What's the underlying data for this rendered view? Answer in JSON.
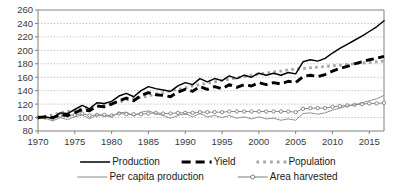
{
  "chart_data": {
    "type": "line",
    "title": "",
    "subtitle": "",
    "xlabel": "",
    "ylabel": "",
    "xlim": [
      1970,
      2017
    ],
    "ylim": [
      80,
      260
    ],
    "ytick_step": 20,
    "xtick_step": 5,
    "grid": "horizontal-dotted",
    "legend_position": "bottom",
    "yticks": [
      80,
      100,
      120,
      140,
      160,
      180,
      200,
      220,
      240,
      260
    ],
    "xticks": [
      1970,
      1975,
      1980,
      1985,
      1990,
      1995,
      2000,
      2005,
      2010,
      2015
    ],
    "x": [
      1970,
      1971,
      1972,
      1973,
      1974,
      1975,
      1976,
      1977,
      1978,
      1979,
      1980,
      1981,
      1982,
      1983,
      1984,
      1985,
      1986,
      1987,
      1988,
      1989,
      1990,
      1991,
      1992,
      1993,
      1994,
      1995,
      1996,
      1997,
      1998,
      1999,
      2000,
      2001,
      2002,
      2003,
      2004,
      2005,
      2006,
      2007,
      2008,
      2009,
      2010,
      2011,
      2012,
      2013,
      2014,
      2015,
      2016,
      2017
    ],
    "series": [
      {
        "name": "Production",
        "style": "solid-black-thin",
        "color": "#000000",
        "values": [
          100,
          101,
          99,
          107,
          106,
          112,
          118,
          113,
          122,
          121,
          124,
          132,
          136,
          131,
          140,
          146,
          143,
          141,
          139,
          147,
          152,
          149,
          158,
          153,
          158,
          155,
          162,
          158,
          163,
          160,
          166,
          163,
          166,
          163,
          167,
          165,
          183,
          186,
          184,
          188,
          196,
          203,
          209,
          215,
          221,
          228,
          235,
          244
        ]
      },
      {
        "name": "Yield",
        "style": "dashed-black-thick",
        "color": "#000000",
        "values": [
          100,
          101,
          100,
          104,
          103,
          107,
          112,
          110,
          117,
          116,
          120,
          125,
          129,
          125,
          133,
          137,
          134,
          133,
          131,
          138,
          142,
          139,
          146,
          142,
          146,
          143,
          149,
          145,
          149,
          147,
          152,
          149,
          152,
          150,
          154,
          152,
          161,
          163,
          161,
          164,
          169,
          173,
          176,
          180,
          183,
          186,
          188,
          191
        ]
      },
      {
        "name": "Population",
        "style": "dotted-gray-thick",
        "color": "#a6a6a6",
        "values": [
          100,
          102,
          104,
          107,
          109,
          111,
          113,
          115,
          117,
          119,
          121,
          123,
          126,
          128,
          130,
          132,
          135,
          137,
          140,
          142,
          144,
          147,
          149,
          151,
          153,
          155,
          157,
          159,
          161,
          163,
          165,
          166,
          168,
          169,
          171,
          172,
          173,
          174,
          175,
          176,
          177,
          178,
          179,
          180,
          181,
          182,
          183,
          184
        ]
      },
      {
        "name": "Per capita production",
        "style": "solid-gray-thin",
        "color": "#8a8a8a",
        "values": [
          100,
          99,
          95,
          100,
          97,
          101,
          104,
          98,
          104,
          102,
          102,
          107,
          108,
          102,
          108,
          110,
          106,
          103,
          99,
          103,
          106,
          101,
          106,
          101,
          103,
          100,
          103,
          99,
          101,
          98,
          101,
          98,
          99,
          96,
          98,
          96,
          106,
          107,
          105,
          107,
          111,
          114,
          117,
          119,
          122,
          125,
          128,
          133
        ]
      },
      {
        "name": "Area harvested",
        "style": "line-with-circle-markers",
        "color": "#7d7d7d",
        "values": [
          100,
          100,
          99,
          103,
          103,
          104,
          106,
          103,
          104,
          104,
          103,
          106,
          105,
          105,
          105,
          106,
          107,
          106,
          106,
          107,
          107,
          107,
          108,
          108,
          108,
          108,
          109,
          109,
          109,
          109,
          109,
          109,
          109,
          109,
          109,
          108,
          113,
          114,
          114,
          114,
          116,
          117,
          118,
          119,
          120,
          121,
          121,
          122
        ]
      }
    ],
    "legend": [
      {
        "label": "Production",
        "style": "solid-black-thin",
        "row": 1
      },
      {
        "label": "Yield",
        "style": "dashed-black-thick",
        "row": 1
      },
      {
        "label": "Population",
        "style": "dotted-gray-thick",
        "row": 1
      },
      {
        "label": "Per capita production",
        "style": "solid-gray-thin",
        "row": 2
      },
      {
        "label": "Area harvested",
        "style": "line-with-circle-markers",
        "row": 2
      }
    ]
  }
}
